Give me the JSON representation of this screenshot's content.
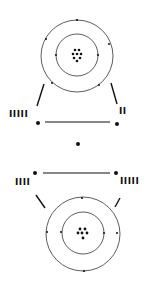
{
  "diagram": {
    "type": "atomic-structure-bonding",
    "colors": {
      "stroke": "#222222",
      "background": "#ffffff"
    },
    "top_atom": {
      "nucleus_particle_count": 8,
      "inner_shell_electrons": 2,
      "outer_shell_electrons": 6
    },
    "bottom_atom": {
      "nucleus_particle_count": 6,
      "inner_shell_electrons": 2,
      "outer_shell_electrons": 4
    },
    "labels": {
      "top_left": "IIIII",
      "top_right": "II",
      "bottom_left": "IIII",
      "bottom_right": "IIIII"
    }
  }
}
